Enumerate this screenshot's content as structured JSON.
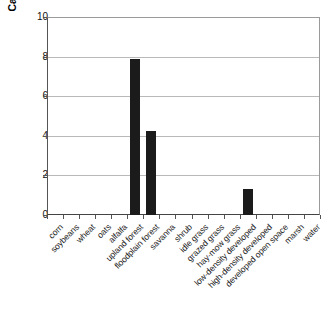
{
  "chart_data": {
    "type": "bar",
    "title": "",
    "xlabel": "",
    "ylabel": "Carolina Wrens/100 acres",
    "ylim": [
      0,
      10
    ],
    "yticks": [
      0,
      2,
      4,
      6,
      8,
      10
    ],
    "ytick_labels": [
      "0",
      "2",
      "4",
      "6",
      "8",
      "10"
    ],
    "grid": "horizontal",
    "legend": "none",
    "bar_color": "#1b1b1b",
    "categories": [
      "corn",
      "soybeans",
      "wheat",
      "oats",
      "alfalfa",
      "upland forest",
      "floodplain forest",
      "savanna",
      "shrub",
      "idle grass",
      "grazed grass",
      "hay-mow grass",
      "low-density developed",
      "high-density developed",
      "developed open space",
      "marsh",
      "water"
    ],
    "values": [
      0,
      0,
      0,
      0,
      0,
      7.9,
      4.25,
      0,
      0,
      0,
      0,
      0,
      1.3,
      0,
      0,
      0,
      0
    ]
  }
}
